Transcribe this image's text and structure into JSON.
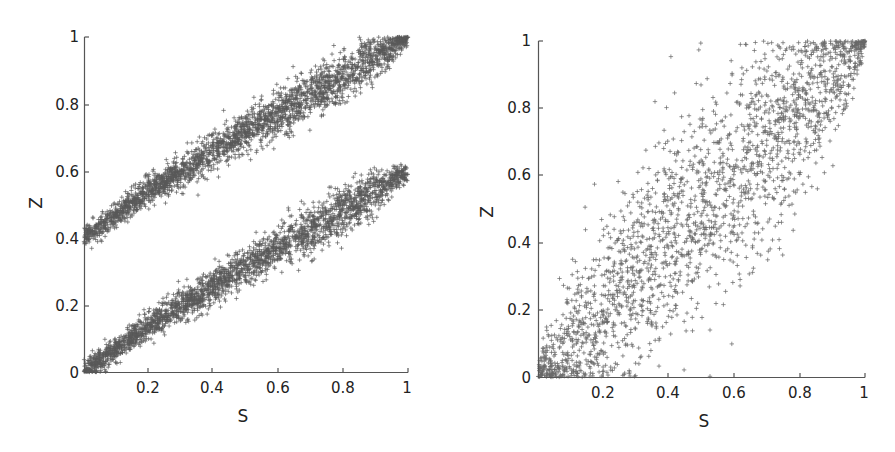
{
  "chart_data": [
    {
      "type": "scatter",
      "title": "",
      "xlabel": "S",
      "ylabel": "Z",
      "xlim": [
        0,
        1
      ],
      "ylim": [
        0,
        1
      ],
      "xticks": [
        "0.2",
        "0.4",
        "0.6",
        "0.8",
        "1"
      ],
      "yticks": [
        "0",
        "0.2",
        "0.4",
        "0.6",
        "0.8",
        "1"
      ],
      "grid": false,
      "marker": "+",
      "marker_color": "#5a5a5a",
      "series": [
        {
          "name": "upper band",
          "description": "Z ≈ 0.4 + 0.6·S, narrow band",
          "x": [
            0,
            0.2,
            0.4,
            0.6,
            0.8,
            1.0
          ],
          "y": [
            0.4,
            0.54,
            0.66,
            0.77,
            0.88,
            1.0
          ],
          "spread": 0.035,
          "n_points": 2600
        },
        {
          "name": "lower band",
          "description": "Z ≈ 0.6·S, narrow band",
          "x": [
            0,
            0.2,
            0.4,
            0.6,
            0.8,
            1.0
          ],
          "y": [
            0.0,
            0.14,
            0.26,
            0.37,
            0.48,
            0.6
          ],
          "spread": 0.035,
          "n_points": 2600
        }
      ]
    },
    {
      "type": "scatter",
      "title": "",
      "xlabel": "S",
      "ylabel": "Z",
      "xlim": [
        0,
        1
      ],
      "ylim": [
        0,
        1
      ],
      "xticks": [
        "0.2",
        "0.4",
        "0.6",
        "0.8",
        "1"
      ],
      "yticks": [
        "0",
        "0.2",
        "0.4",
        "0.6",
        "0.8",
        "1"
      ],
      "grid": false,
      "marker": "+",
      "marker_color": "#6a6a6a",
      "series": [
        {
          "name": "diffuse band",
          "description": "Z ≈ S with wide spread, narrowing near 0 and 1",
          "x": [
            0,
            0.2,
            0.4,
            0.6,
            0.8,
            1.0
          ],
          "y": [
            0.0,
            0.2,
            0.4,
            0.6,
            0.8,
            1.0
          ],
          "spread": 0.16,
          "n_points": 2200
        }
      ]
    }
  ],
  "panels": [
    {
      "xlabel": "S",
      "ylabel": "Z",
      "xticks": [
        "0.2",
        "0.4",
        "0.6",
        "0.8",
        "1"
      ],
      "yticks": [
        "0",
        "0.2",
        "0.4",
        "0.6",
        "0.8",
        "1"
      ]
    },
    {
      "xlabel": "S",
      "ylabel": "Z",
      "xticks": [
        "0.2",
        "0.4",
        "0.6",
        "0.8",
        "1"
      ],
      "yticks": [
        "0",
        "0.2",
        "0.4",
        "0.6",
        "0.8",
        "1"
      ]
    }
  ]
}
